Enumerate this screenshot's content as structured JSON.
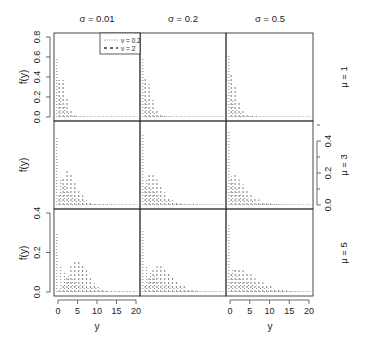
{
  "chart_data": {
    "type": "bar",
    "layout": "3x3 panel grid",
    "xlabel": "y",
    "ylabel": "f(y)",
    "column_strips": [
      "σ = 0.01",
      "σ = 0.2",
      "σ = 0.5"
    ],
    "row_strips": [
      "μ = 1",
      "μ = 3",
      "μ = 5"
    ],
    "x_ticks": [
      0,
      5,
      10,
      15,
      20
    ],
    "xlim": [
      0,
      20
    ],
    "row_ylims": [
      [
        0,
        0.8
      ],
      [
        0,
        0.5
      ],
      [
        0,
        0.4
      ]
    ],
    "row_y_ticks": [
      [
        "0.0",
        "0.2",
        "0.4",
        "0.6",
        "0.8"
      ],
      [
        "0.0",
        "0.2",
        "0.4"
      ],
      [
        "0.0",
        "0.2",
        "0.4"
      ]
    ],
    "row_y_tick_values": [
      [
        0,
        0.2,
        0.4,
        0.6,
        0.8
      ],
      [
        0,
        0.2,
        0.4
      ],
      [
        0,
        0.2,
        0.4
      ]
    ],
    "legend": {
      "position": "top-right of top-left panel",
      "entries": [
        {
          "label": "ν = 0.2",
          "style": "dotted"
        },
        {
          "label": "ν = 2",
          "style": "dashed"
        }
      ]
    },
    "x": [
      0,
      1,
      2,
      3,
      4,
      5,
      6,
      7,
      8,
      9,
      10,
      11,
      12,
      13,
      14,
      15,
      16,
      17,
      18,
      19,
      20
    ],
    "panels": [
      {
        "row": 0,
        "col": 0,
        "sigma": 0.01,
        "mu": 1,
        "series": [
          {
            "name": "ν = 0.2",
            "values": [
              0.58,
              0.19,
              0.1,
              0.06,
              0.03,
              0.02,
              0.01,
              0.01,
              0.005,
              0.005,
              0.003,
              0.002,
              0.002,
              0.001,
              0.001,
              0.001,
              0.001,
              0,
              0,
              0,
              0
            ]
          },
          {
            "name": "ν = 2",
            "values": [
              0.37,
              0.37,
              0.18,
              0.06,
              0.02,
              0.003,
              0,
              0,
              0,
              0,
              0,
              0,
              0,
              0,
              0,
              0,
              0,
              0,
              0,
              0,
              0
            ]
          }
        ]
      },
      {
        "row": 0,
        "col": 1,
        "sigma": 0.2,
        "mu": 1,
        "series": [
          {
            "name": "ν = 0.2",
            "values": [
              0.6,
              0.18,
              0.09,
              0.05,
              0.03,
              0.02,
              0.01,
              0.01,
              0.005,
              0.004,
              0.003,
              0.002,
              0.002,
              0.001,
              0.001,
              0.001,
              0.001,
              0,
              0,
              0,
              0
            ]
          },
          {
            "name": "ν = 2",
            "values": [
              0.4,
              0.33,
              0.17,
              0.07,
              0.02,
              0.01,
              0.003,
              0,
              0,
              0,
              0,
              0,
              0,
              0,
              0,
              0,
              0,
              0,
              0,
              0,
              0
            ]
          }
        ]
      },
      {
        "row": 0,
        "col": 2,
        "sigma": 0.5,
        "mu": 1,
        "series": [
          {
            "name": "ν = 0.2",
            "values": [
              0.62,
              0.17,
              0.08,
              0.05,
              0.03,
              0.02,
              0.01,
              0.01,
              0.005,
              0.004,
              0.003,
              0.002,
              0.002,
              0.001,
              0.001,
              0.001,
              0.001,
              0,
              0,
              0,
              0
            ]
          },
          {
            "name": "ν = 2",
            "values": [
              0.44,
              0.3,
              0.15,
              0.07,
              0.03,
              0.01,
              0.004,
              0.001,
              0,
              0,
              0,
              0,
              0,
              0,
              0,
              0,
              0,
              0,
              0,
              0,
              0
            ]
          }
        ]
      },
      {
        "row": 1,
        "col": 0,
        "sigma": 0.01,
        "mu": 3,
        "series": [
          {
            "name": "ν = 0.2",
            "values": [
              0.42,
              0.16,
              0.12,
              0.08,
              0.06,
              0.04,
              0.03,
              0.025,
              0.02,
              0.015,
              0.012,
              0.01,
              0.008,
              0.006,
              0.005,
              0.004,
              0.003,
              0.003,
              0.002,
              0.002,
              0.001
            ]
          },
          {
            "name": "ν = 2",
            "values": [
              0.07,
              0.17,
              0.22,
              0.2,
              0.15,
              0.1,
              0.06,
              0.03,
              0.015,
              0.007,
              0.003,
              0.001,
              0,
              0,
              0,
              0,
              0,
              0,
              0,
              0,
              0
            ]
          }
        ]
      },
      {
        "row": 1,
        "col": 1,
        "sigma": 0.2,
        "mu": 3,
        "series": [
          {
            "name": "ν = 0.2",
            "values": [
              0.44,
              0.16,
              0.11,
              0.08,
              0.06,
              0.04,
              0.03,
              0.025,
              0.02,
              0.015,
              0.012,
              0.01,
              0.008,
              0.006,
              0.005,
              0.004,
              0.003,
              0.003,
              0.002,
              0.002,
              0.001
            ]
          },
          {
            "name": "ν = 2",
            "values": [
              0.12,
              0.19,
              0.19,
              0.16,
              0.12,
              0.08,
              0.05,
              0.03,
              0.02,
              0.01,
              0.005,
              0.003,
              0.001,
              0,
              0,
              0,
              0,
              0,
              0,
              0,
              0
            ]
          }
        ]
      },
      {
        "row": 1,
        "col": 2,
        "sigma": 0.5,
        "mu": 3,
        "series": [
          {
            "name": "ν = 0.2",
            "values": [
              0.46,
              0.15,
              0.1,
              0.07,
              0.05,
              0.04,
              0.03,
              0.02,
              0.018,
              0.014,
              0.011,
              0.009,
              0.007,
              0.006,
              0.005,
              0.004,
              0.003,
              0.003,
              0.002,
              0.002,
              0.001
            ]
          },
          {
            "name": "ν = 2",
            "values": [
              0.18,
              0.19,
              0.16,
              0.13,
              0.1,
              0.07,
              0.05,
              0.035,
              0.024,
              0.016,
              0.01,
              0.007,
              0.004,
              0.002,
              0.001,
              0,
              0,
              0,
              0,
              0,
              0
            ]
          }
        ]
      },
      {
        "row": 2,
        "col": 0,
        "sigma": 0.01,
        "mu": 5,
        "series": [
          {
            "name": "ν = 0.2",
            "values": [
              0.3,
              0.13,
              0.1,
              0.08,
              0.065,
              0.05,
              0.04,
              0.035,
              0.03,
              0.025,
              0.02,
              0.017,
              0.014,
              0.012,
              0.01,
              0.008,
              0.007,
              0.006,
              0.005,
              0.004,
              0.003
            ]
          },
          {
            "name": "ν = 2",
            "values": [
              0.01,
              0.03,
              0.08,
              0.13,
              0.16,
              0.16,
              0.14,
              0.11,
              0.07,
              0.045,
              0.025,
              0.013,
              0.006,
              0.003,
              0.001,
              0,
              0,
              0,
              0,
              0,
              0
            ]
          }
        ]
      },
      {
        "row": 2,
        "col": 1,
        "sigma": 0.2,
        "mu": 5,
        "series": [
          {
            "name": "ν = 0.2",
            "values": [
              0.32,
              0.13,
              0.1,
              0.08,
              0.06,
              0.05,
              0.04,
              0.034,
              0.028,
              0.023,
              0.019,
              0.016,
              0.013,
              0.011,
              0.009,
              0.008,
              0.007,
              0.006,
              0.005,
              0.004,
              0.003
            ]
          },
          {
            "name": "ν = 2",
            "values": [
              0.04,
              0.08,
              0.11,
              0.13,
              0.13,
              0.12,
              0.1,
              0.08,
              0.06,
              0.04,
              0.03,
              0.02,
              0.012,
              0.007,
              0.004,
              0.002,
              0.001,
              0,
              0,
              0,
              0
            ]
          }
        ]
      },
      {
        "row": 2,
        "col": 2,
        "sigma": 0.5,
        "mu": 5,
        "series": [
          {
            "name": "ν = 0.2",
            "values": [
              0.34,
              0.12,
              0.09,
              0.07,
              0.06,
              0.05,
              0.04,
              0.033,
              0.027,
              0.022,
              0.018,
              0.015,
              0.013,
              0.011,
              0.009,
              0.008,
              0.007,
              0.006,
              0.005,
              0.004,
              0.003
            ]
          },
          {
            "name": "ν = 2",
            "values": [
              0.1,
              0.12,
              0.12,
              0.11,
              0.1,
              0.09,
              0.07,
              0.06,
              0.05,
              0.04,
              0.03,
              0.022,
              0.016,
              0.011,
              0.008,
              0.005,
              0.003,
              0.002,
              0.001,
              0.001,
              0
            ]
          }
        ]
      }
    ]
  }
}
